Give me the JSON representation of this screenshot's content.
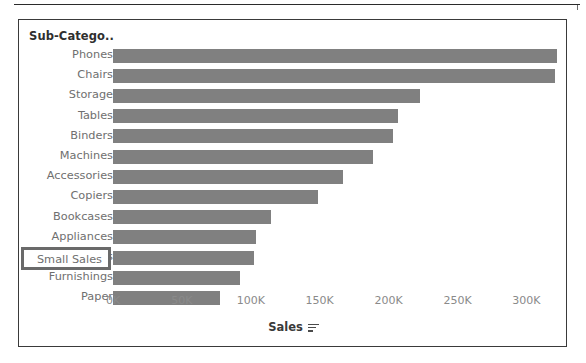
{
  "panel": {
    "field_header": "Sub-Catego..",
    "bar_color": "#808080",
    "border_color": "#3a3a3a",
    "label_color": "#6f6f6f",
    "highlight_border_color": "#6a6a6a"
  },
  "selection": {
    "label": "Small Sales",
    "is_highlighted": true
  },
  "axis": {
    "title": "Sales",
    "sort_icon": "sort-descending-icon",
    "ticks": [
      "0K",
      "50K",
      "100K",
      "150K",
      "200K",
      "250K",
      "300K"
    ]
  },
  "chart_data": {
    "type": "bar",
    "orientation": "horizontal",
    "title": "",
    "xlabel": "Sales",
    "ylabel": "Sub-Catego..",
    "xlim": [
      0,
      325000
    ],
    "grid": false,
    "legend": null,
    "tick_values": [
      0,
      50000,
      100000,
      150000,
      200000,
      250000,
      300000
    ],
    "tick_labels": [
      "0K",
      "50K",
      "100K",
      "150K",
      "200K",
      "250K",
      "300K"
    ],
    "categories": [
      "Phones",
      "Chairs",
      "Storage",
      "Tables",
      "Binders",
      "Machines",
      "Accessories",
      "Copiers",
      "Bookcases",
      "Appliances",
      "Small Sales",
      "Furnishings",
      "Paper"
    ],
    "values": [
      322000,
      321000,
      223000,
      207000,
      203000,
      189000,
      167000,
      149000,
      115000,
      104000,
      102000,
      92000,
      78000
    ]
  }
}
